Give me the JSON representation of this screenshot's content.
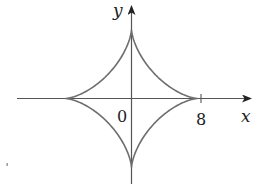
{
  "figure": {
    "type": "astroid",
    "equation": "x^(2/3) + y^(2/3) = 8^(2/3)",
    "curve_color": "#6e6e6e",
    "axis_color": "#444444"
  },
  "axes": {
    "x_label": "x",
    "y_label": "y",
    "origin_label": "0",
    "x_tick_label": "8"
  }
}
